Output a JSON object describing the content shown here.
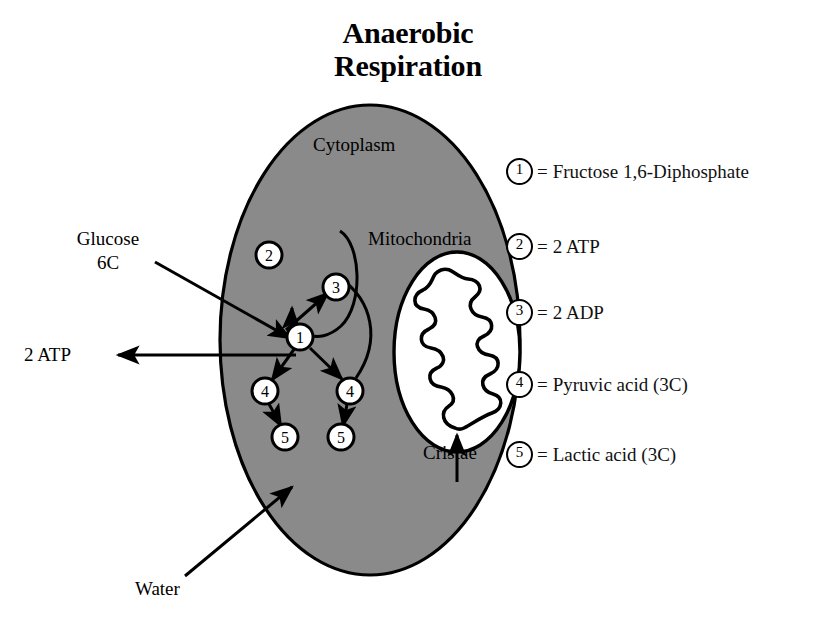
{
  "title": {
    "line1": "Anaerobic",
    "line2": "Respiration"
  },
  "diagram": {
    "cell_label": "Cytoplasm",
    "organelle_label": "Mitochondria",
    "cristae_label": "Cristae",
    "input_label_line1": "Glucose",
    "input_label_line2": "6C",
    "output_label": "2 ATP",
    "water_label": "Water",
    "nodes": [
      {
        "id": "1",
        "label": "1"
      },
      {
        "id": "2",
        "label": "2"
      },
      {
        "id": "3",
        "label": "3"
      },
      {
        "id": "4a",
        "label": "4"
      },
      {
        "id": "4b",
        "label": "4"
      },
      {
        "id": "5a",
        "label": "5"
      },
      {
        "id": "5b",
        "label": "5"
      }
    ],
    "cell_fill": "#8a8a8a",
    "organelle_fill": "#ffffff",
    "stroke": "#000000"
  },
  "legend": {
    "equals": "=",
    "items": [
      {
        "number": "1",
        "text": "Fructose 1,6-Diphosphate"
      },
      {
        "number": "2",
        "text": "2 ATP"
      },
      {
        "number": "3",
        "text": "2 ADP"
      },
      {
        "number": "4",
        "text": "Pyruvic acid (3C)"
      },
      {
        "number": "5",
        "text": "Lactic acid (3C)"
      }
    ]
  }
}
